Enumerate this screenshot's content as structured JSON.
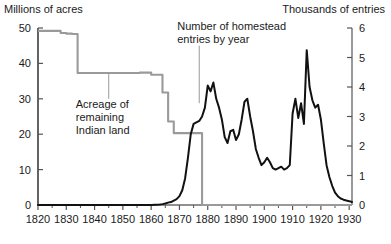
{
  "chart_data": {
    "type": "line",
    "title": "",
    "subtitle": "",
    "grid": false,
    "legend_position": "inline-annotations",
    "xlabel": "",
    "xlim": [
      1820,
      1931
    ],
    "x_ticks": [
      1820,
      1830,
      1840,
      1850,
      1860,
      1870,
      1880,
      1890,
      1900,
      1910,
      1920,
      1930
    ],
    "x_tick_labels": [
      "1820",
      "1830",
      "1840",
      "1850",
      "1860",
      "1870",
      "1880",
      "1890",
      "1900",
      "1910",
      "1920",
      "1930"
    ],
    "x_minor_tick_interval": 5,
    "left_axis": {
      "label": "Millions of acres",
      "ylim": [
        0,
        50
      ],
      "ticks": [
        0,
        10,
        20,
        30,
        40,
        50
      ],
      "tick_labels": [
        "0",
        "10",
        "20",
        "30",
        "40",
        "50"
      ]
    },
    "right_axis": {
      "label": "Thousands of entries",
      "ylim": [
        0,
        6
      ],
      "ticks": [
        0,
        1,
        2,
        3,
        4,
        5,
        6
      ],
      "tick_labels": [
        "0",
        "1",
        "2",
        "3",
        "4",
        "5",
        "6"
      ]
    },
    "series": [
      {
        "name": "Acreage of remaining Indian land",
        "axis": "left",
        "units": "millions of acres",
        "color": "#9a9a9a",
        "style": "step",
        "x": [
          1820,
          1826,
          1828,
          1830,
          1832,
          1833,
          1834,
          1850,
          1856,
          1858,
          1860,
          1864,
          1866,
          1868,
          1876,
          1877,
          1878,
          1931
        ],
        "y": [
          49.2,
          49.2,
          48.6,
          48.4,
          48.3,
          48.3,
          37.3,
          37.3,
          37.4,
          37.4,
          36.8,
          31.8,
          23.6,
          20.3,
          20.3,
          20.3,
          0,
          0
        ]
      },
      {
        "name": "Number of homestead entries by year",
        "axis": "right",
        "units": "thousands of entries",
        "color": "#111111",
        "style": "line",
        "x": [
          1820,
          1860,
          1863,
          1864,
          1865,
          1866,
          1867,
          1868,
          1869,
          1870,
          1871,
          1872,
          1873,
          1874,
          1875,
          1876,
          1877,
          1878,
          1879,
          1880,
          1881,
          1882,
          1883,
          1884,
          1885,
          1886,
          1887,
          1888,
          1889,
          1890,
          1891,
          1892,
          1893,
          1894,
          1895,
          1896,
          1897,
          1898,
          1899,
          1900,
          1901,
          1902,
          1903,
          1904,
          1905,
          1906,
          1907,
          1908,
          1909,
          1910,
          1911,
          1912,
          1913,
          1914,
          1915,
          1916,
          1917,
          1918,
          1919,
          1920,
          1921,
          1922,
          1923,
          1924,
          1925,
          1926,
          1927,
          1928,
          1929,
          1930,
          1931
        ],
        "y": [
          0,
          0,
          0.02,
          0.03,
          0.05,
          0.08,
          0.1,
          0.15,
          0.2,
          0.3,
          0.5,
          0.9,
          1.6,
          2.4,
          2.75,
          2.8,
          2.85,
          3.0,
          3.3,
          4.05,
          3.85,
          4.15,
          3.6,
          3.3,
          2.9,
          2.3,
          2.1,
          2.5,
          2.55,
          2.2,
          2.4,
          2.9,
          3.5,
          3.6,
          3.0,
          2.5,
          1.9,
          1.6,
          1.35,
          1.45,
          1.6,
          1.45,
          1.25,
          1.2,
          1.25,
          1.3,
          1.2,
          1.25,
          1.35,
          3.1,
          3.6,
          2.95,
          3.45,
          2.75,
          5.25,
          4.0,
          3.55,
          3.3,
          3.4,
          2.9,
          2.1,
          1.35,
          0.95,
          0.65,
          0.42,
          0.3,
          0.22,
          0.18,
          0.15,
          0.13,
          0.1
        ]
      }
    ],
    "annotations": [
      {
        "name": "indian-land-annotation",
        "lines": [
          "Acreage of",
          "remaining",
          "Indian land"
        ],
        "leader_from_x": 1845,
        "leader_from_y_left": 30.0,
        "leader_to_x": 1845,
        "leader_to_y_left": 37.3
      },
      {
        "name": "homestead-entries-annotation",
        "lines": [
          "Number of homestead",
          "entries by year"
        ],
        "leader_from_x": 1877,
        "leader_from_y_right": 5.4,
        "leader_to_x": 1877,
        "leader_to_y_right": 3.45
      }
    ],
    "colors": {
      "indian_land_line": "#9a9a9a",
      "homestead_line": "#111111",
      "axis": "#555555",
      "text": "#1a1a1a",
      "background": "#ffffff"
    }
  },
  "labels": {
    "left_axis_title": "Millions of acres",
    "right_axis_title": "Thousands of entries",
    "annotation_indian_line1": "Acreage of",
    "annotation_indian_line2": "remaining",
    "annotation_indian_line3": "Indian land",
    "annotation_homestead_line1": "Number of homestead",
    "annotation_homestead_line2": "entries by year"
  }
}
